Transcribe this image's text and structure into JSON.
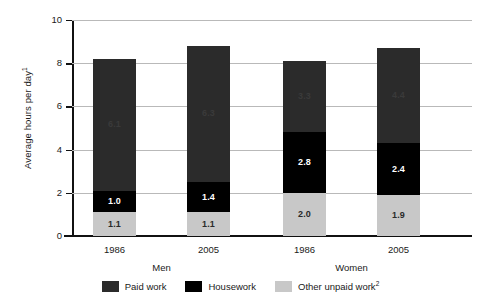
{
  "chart_data": {
    "type": "bar",
    "subtype": "stacked-bar",
    "title": "",
    "xlabel": "",
    "ylabel": "Average hours per day",
    "ylabel_superscript": "1",
    "ylim": [
      0,
      10
    ],
    "yticks": [
      0,
      2,
      4,
      6,
      8,
      10
    ],
    "ytick_labels": [
      "0",
      "2",
      "4",
      "6",
      "8",
      "10"
    ],
    "grid": true,
    "grid_axis": "y",
    "legend_position": "bottom",
    "categories": [
      "1986",
      "2005",
      "1986",
      "2005"
    ],
    "groups": [
      {
        "label": "Men",
        "categories": [
          "1986",
          "2005"
        ]
      },
      {
        "label": "Women",
        "categories": [
          "1986",
          "2005"
        ]
      }
    ],
    "series": [
      {
        "name": "Paid work",
        "color": "#2b2b2b",
        "values": [
          6.1,
          6.3,
          3.3,
          4.4
        ],
        "labels": [
          "6.1",
          "6.3",
          "3.3",
          "4.4"
        ]
      },
      {
        "name": "Housework",
        "color": "#000000",
        "values": [
          1.0,
          1.4,
          2.8,
          2.4
        ],
        "labels": [
          "1.0",
          "1.4",
          "2.8",
          "2.4"
        ]
      },
      {
        "name": "Other unpaid work",
        "name_superscript": "2",
        "color": "#c8c8c8",
        "values": [
          1.1,
          1.1,
          2.0,
          1.9
        ],
        "labels": [
          "1.1",
          "1.1",
          "2.0",
          "1.9"
        ]
      }
    ],
    "totals": [
      8.2,
      8.8,
      8.1,
      8.7
    ],
    "stack_order_bottom_to_top": [
      "Other unpaid work",
      "Housework",
      "Paid work"
    ]
  },
  "axis": {
    "y_title": "Average hours per day",
    "y_title_superscript": "1"
  },
  "legend": {
    "items": [
      {
        "label": "Paid work",
        "superscript": "",
        "color": "#2b2b2b"
      },
      {
        "label": "Housework",
        "superscript": "",
        "color": "#000000"
      },
      {
        "label": "Other unpaid work",
        "superscript": "2",
        "color": "#c8c8c8"
      }
    ]
  }
}
